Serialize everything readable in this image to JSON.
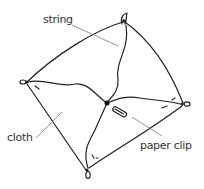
{
  "diagram": {
    "labels": {
      "string": "string",
      "cloth": "cloth",
      "paper_clip": "paper clip"
    },
    "ink_color": "#222222",
    "pointer_color": "#777777"
  }
}
